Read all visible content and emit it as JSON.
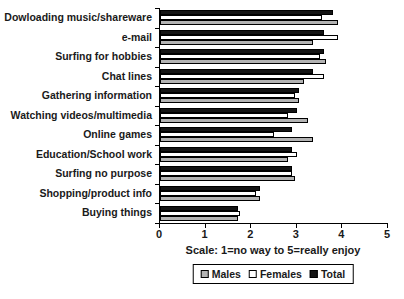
{
  "chart_data": {
    "type": "bar",
    "orientation": "horizontal",
    "title": "",
    "xlabel": "Scale:  1=no way to 5=really enjoy",
    "xlim": [
      0,
      5
    ],
    "xticks": [
      "0",
      "1",
      "2",
      "3",
      "4",
      "5"
    ],
    "grid": false,
    "legend_position": "bottom",
    "categories": [
      "Dowloading music/shareware",
      "e-mail",
      "Surfing for hobbies",
      "Chat lines",
      "Gathering information",
      "Watching videos/multimedia",
      "Online games",
      "Education/School work",
      "Surfing no purpose",
      "Shopping/product info",
      "Buying things"
    ],
    "series": [
      {
        "name": "Males",
        "color": "#b3b3b3",
        "values": [
          3.9,
          3.35,
          3.65,
          3.15,
          3.05,
          3.25,
          3.35,
          2.8,
          2.95,
          2.2,
          1.7
        ]
      },
      {
        "name": "Females",
        "color": "#ffffff",
        "values": [
          3.55,
          3.9,
          3.5,
          3.6,
          2.95,
          2.8,
          2.5,
          3.0,
          2.9,
          2.1,
          1.75
        ]
      },
      {
        "name": "Total",
        "color": "#141414",
        "values": [
          3.8,
          3.6,
          3.6,
          3.35,
          3.05,
          3.0,
          2.9,
          2.9,
          2.9,
          2.2,
          1.7
        ]
      }
    ],
    "bar_order_top_to_bottom": [
      "Total",
      "Females",
      "Males"
    ]
  },
  "legend": {
    "items": [
      {
        "label": "Males",
        "color": "#b3b3b3"
      },
      {
        "label": "Females",
        "color": "#ffffff"
      },
      {
        "label": "Total",
        "color": "#141414"
      }
    ]
  }
}
